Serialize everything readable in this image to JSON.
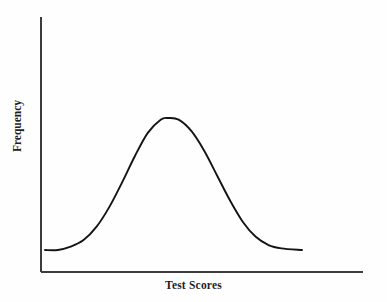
{
  "chart_data": {
    "type": "line",
    "title": "",
    "subtitle": "",
    "xlabel": "Test Scores",
    "ylabel": "Frequency",
    "legend": [],
    "grid": false,
    "axis_style": "open-left-bottom",
    "xlim": [
      0,
      1
    ],
    "ylim": [
      0,
      1
    ],
    "xticks": [],
    "yticks": [],
    "xticklabels": [],
    "yticklabels": [],
    "series": [
      {
        "name": "Test score frequency distribution",
        "shape": "gaussian",
        "peak_x": 0.48,
        "peak_y": 0.88,
        "baseline_y": 0.08,
        "x": [
          0.0,
          0.05,
          0.1,
          0.15,
          0.2,
          0.25,
          0.3,
          0.35,
          0.4,
          0.45,
          0.48,
          0.52,
          0.57,
          0.62,
          0.67,
          0.72,
          0.77,
          0.82,
          0.87,
          0.92,
          1.0
        ],
        "values": [
          0.08,
          0.08,
          0.1,
          0.14,
          0.22,
          0.34,
          0.49,
          0.65,
          0.79,
          0.87,
          0.88,
          0.87,
          0.8,
          0.68,
          0.53,
          0.38,
          0.25,
          0.16,
          0.11,
          0.09,
          0.08
        ]
      }
    ],
    "curve_geometry": {
      "note": "pixel-space control points measured from the source image (387x302 canvas)",
      "left_tail_start": [
        45,
        250
      ],
      "peak": [
        168,
        118
      ],
      "right_tail_end": [
        302,
        250
      ],
      "left_inflection": [
        112,
        186
      ],
      "right_inflection": [
        226,
        186
      ]
    },
    "axes_geometry": {
      "y_axis_x": 41,
      "y_axis_top": 17,
      "y_axis_bottom": 272,
      "x_axis_y": 272,
      "x_axis_left": 41,
      "x_axis_right": 363
    },
    "colors": {
      "background": "#fefefe",
      "curve": "#141414",
      "axis": "#3c3c3c",
      "label_text": "#1f1f1f"
    }
  }
}
